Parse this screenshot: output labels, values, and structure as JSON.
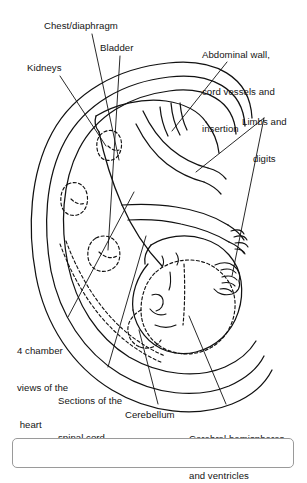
{
  "figure": {
    "background_color": "#ffffff",
    "line_color": "#111111",
    "text_color": "#141414"
  },
  "labels": {
    "chest_diaphragm": "Chest/diaphragm",
    "bladder": "Bladder",
    "kidneys": "Kidneys",
    "abdominal_wall_line1": "Abdominal wall,",
    "abdominal_wall_line2": "cord vessels and",
    "abdominal_wall_line3": "insertion",
    "limbs_line1": "Limbs and",
    "limbs_line2": "digits",
    "four_chamber_line1": "4 chamber",
    "four_chamber_line2": "views of the",
    "four_chamber_line3": " heart",
    "sections_line1": "Sections of the",
    "sections_line2": "spinal cord",
    "cerebellum": "Cerebellum",
    "cerebral_line1": "Cerebral hemispheres",
    "cerebral_line2": "and ventricles"
  },
  "drawing": {
    "uterus_layers": 3,
    "dashed_structures": [
      "kidneys",
      "bladder",
      "cerebral-hemispheres",
      "cerebellum",
      "spinal-cord"
    ],
    "solid_structures": [
      "uterine-wall",
      "fetal-body",
      "limbs",
      "digits",
      "head-outline",
      "face"
    ]
  }
}
